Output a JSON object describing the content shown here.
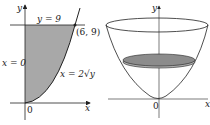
{
  "left_figure": {
    "labels": {
      "y_axis": "y",
      "x_axis": "x",
      "origin": "0",
      "top_line": "y = 9",
      "left_line": "x = 0",
      "curve": "x = 2√y",
      "point": "(6, 9)"
    },
    "fill_color": "#a8a8a8"
  },
  "right_figure": {
    "labels": {
      "y_axis": "y",
      "x_axis": "x",
      "origin": "0"
    },
    "disk_color": "#8c8c8c"
  }
}
